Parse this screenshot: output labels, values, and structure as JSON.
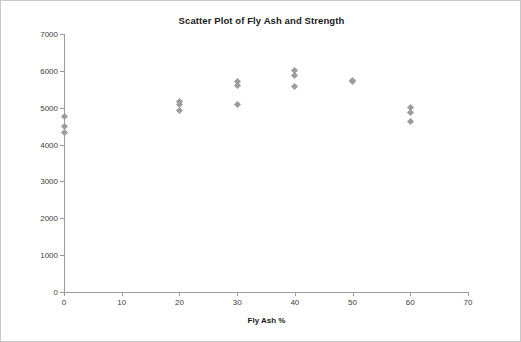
{
  "chart_data": {
    "type": "scatter",
    "title": "Scatter Plot of Fly Ash and Strength",
    "xlabel": "Fly Ash %",
    "ylabel": "Strength (PSI)",
    "xlim": [
      0,
      70
    ],
    "ylim": [
      0,
      7000
    ],
    "xticks": [
      0,
      10,
      20,
      30,
      40,
      50,
      60,
      70
    ],
    "yticks": [
      0,
      1000,
      2000,
      3000,
      4000,
      5000,
      6000,
      7000
    ],
    "grid": false,
    "legend": false,
    "marker": "diamond",
    "marker_color": "#9c9c9c",
    "points": [
      {
        "x": 0,
        "y": 4750
      },
      {
        "x": 0,
        "y": 4500
      },
      {
        "x": 0,
        "y": 4330
      },
      {
        "x": 20,
        "y": 5180
      },
      {
        "x": 20,
        "y": 5080
      },
      {
        "x": 20,
        "y": 4930
      },
      {
        "x": 30,
        "y": 5700
      },
      {
        "x": 30,
        "y": 5600
      },
      {
        "x": 30,
        "y": 5080
      },
      {
        "x": 40,
        "y": 6000
      },
      {
        "x": 40,
        "y": 5880
      },
      {
        "x": 40,
        "y": 5580
      },
      {
        "x": 50,
        "y": 5750
      },
      {
        "x": 50,
        "y": 5700
      },
      {
        "x": 60,
        "y": 5000
      },
      {
        "x": 60,
        "y": 4880
      },
      {
        "x": 60,
        "y": 4620
      }
    ]
  }
}
